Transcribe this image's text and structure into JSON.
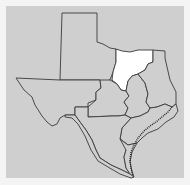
{
  "map": {
    "subject": "Texas regions",
    "colors": {
      "background": "#cfcfcf",
      "region_fill": "#cfcfcf",
      "highlight_fill": "#ffffff",
      "border": "#3a3a3a",
      "frame": "#f4f4f4"
    },
    "highlighted_region": "north-central",
    "regions": [
      {
        "id": "panhandle",
        "highlighted": false,
        "points": "62,13 97,13 97,42 103,44 110,48 116,49 116,62 113,72 110,80 102,82 100,80 60,80"
      },
      {
        "id": "west",
        "highlighted": false,
        "points": "16,78 60,80 100,80 101,88 96,92 96,100 88,103 88,107 75,107 75,107 75,115 65,115 60,118 57,124 52,126 47,122 42,116 35,105 32,97 24,90"
      },
      {
        "id": "north-central",
        "highlighted": true,
        "points": "116,49 122,51 130,52 138,50 147,50 153,50 153,62 148,64 145,70 138,74 132,76 128,81 126,91 121,90 117,84 112,80 113,72 116,62"
      },
      {
        "id": "central",
        "highlighted": false,
        "points": "100,80 110,80 117,84 121,90 126,91 129,96 124,102 128,108 125,115 118,116 112,116 88,117 88,107 96,100 96,92 101,88"
      },
      {
        "id": "east-central",
        "highlighted": false,
        "points": "126,91 128,81 132,76 138,74 145,83 148,94 146,102 150,108 148,112 140,116 131,118 125,115 128,108 124,102 129,96"
      },
      {
        "id": "northeast",
        "highlighted": false,
        "points": "153,50 165,51 165,58 170,80 176,92 176,104 172,107 165,104 157,107 150,108 146,102 148,94 145,83 138,74 145,70 148,64 153,62"
      },
      {
        "id": "southeast",
        "highlighted": false,
        "points": "150,108 157,107 165,104 172,107 176,104 178,111 174,117 166,122 158,129 148,133 142,138 137,143 128,145 120,139 122,128 131,118 140,116 148,112"
      },
      {
        "id": "south-central",
        "highlighted": false,
        "points": "75,115 75,107 88,107 88,117 112,116 118,116 125,115 131,118 122,128 120,139 128,145 126,150 124,157 126,168 130,174 122,170 111,165 100,158 96,150 92,140 86,130 80,122"
      },
      {
        "id": "south-coast",
        "highlighted": false,
        "points": "120,139 128,145 137,143 132,152 130,162 132,172 134,177 130,174 126,168 124,157 126,150"
      },
      {
        "id": "big-bend",
        "highlighted": false,
        "points": "65,115 75,115 80,122 86,130 92,140 96,150 100,158 111,165 122,170 130,174 134,177 131,178 120,174 108,167 98,161 91,150 85,136 78,124 72,118 65,117"
      }
    ],
    "coastline": "172,107 168,112 162,117 156,122 150,126 144,131 138,138 134,145 131,152 130,160 131,168 133,175"
  }
}
